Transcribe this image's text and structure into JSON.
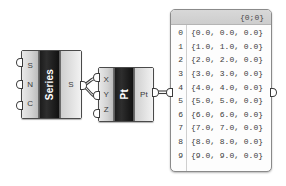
{
  "canvas": {
    "background_color": "#ffffff",
    "app": "Grasshopper Canvas"
  },
  "components": [
    {
      "id": "series",
      "name": "Series",
      "nickname": "Series",
      "inputs": [
        {
          "label": "S",
          "name": "start"
        },
        {
          "label": "N",
          "name": "step"
        },
        {
          "label": "C",
          "name": "count"
        }
      ],
      "outputs": [
        {
          "label": "S",
          "name": "series"
        }
      ]
    },
    {
      "id": "construct-point",
      "name": "Pt",
      "nickname": "Pt",
      "inputs": [
        {
          "label": "X",
          "name": "x-coordinate"
        },
        {
          "label": "Y",
          "name": "y-coordinate"
        },
        {
          "label": "Z",
          "name": "z-coordinate"
        }
      ],
      "outputs": [
        {
          "label": "Pt",
          "name": "point"
        }
      ]
    }
  ],
  "panel": {
    "header": "{0;0}",
    "rows": [
      {
        "index": "0",
        "value": "{0.0, 0.0, 0.0}"
      },
      {
        "index": "1",
        "value": "{1.0, 1.0, 0.0}"
      },
      {
        "index": "2",
        "value": "{2.0, 2.0, 0.0}"
      },
      {
        "index": "3",
        "value": "{3.0, 3.0, 0.0}"
      },
      {
        "index": "4",
        "value": "{4.0, 4.0, 0.0}"
      },
      {
        "index": "5",
        "value": "{5.0, 5.0, 0.0}"
      },
      {
        "index": "6",
        "value": "{6.0, 6.0, 0.0}"
      },
      {
        "index": "7",
        "value": "{7.0, 7.0, 0.0}"
      },
      {
        "index": "8",
        "value": "{8.0, 8.0, 0.0}"
      },
      {
        "index": "9",
        "value": "{9.0, 9.0, 0.0}"
      }
    ]
  },
  "colors": {
    "wire": "#3c3c3c",
    "component_border": "#4a4a4a",
    "nameplate": "#1c1c1c",
    "panel_border": "#8a8a8a",
    "panel_header": "#d2d2d2"
  }
}
